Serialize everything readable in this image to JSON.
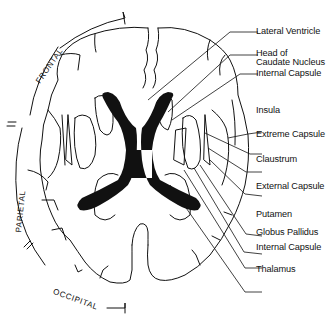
{
  "diagram": {
    "type": "axial brain section (horizontal cut) showing basal ganglia",
    "ink_color": "#111111",
    "background": "#ffffff"
  },
  "regions": {
    "frontal": "FRONTAL",
    "parietal": "PARIETAL",
    "occipital": "OCCIPITAL"
  },
  "labels": {
    "lateral_ventricle": "Lateral Ventricle",
    "head_of_caudate_line1": "Head of",
    "head_of_caudate_line2": "Caudate Nucleus",
    "internal_capsule_anterior": "Internal Capsule",
    "insula": "Insula",
    "extreme_capsule": "Extreme Capsule",
    "claustrum": "Claustrum",
    "external_capsule": "External Capsule",
    "putamen": "Putamen",
    "globus_pallidus": "Globus Pallidus",
    "internal_capsule_posterior": "Internal Capsule",
    "thalamus": "Thalamus"
  }
}
